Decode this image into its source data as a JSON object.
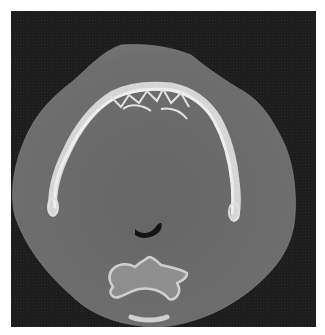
{
  "image": {
    "type": "axial CT slice",
    "description": "Axial CT of lower face at mandible level showing U-shaped mandibular arch, soft tissue, oropharyngeal airway and cervical vertebra",
    "colors": {
      "background": "#ffffff",
      "air": "#1e1e1e",
      "soft_tissue": "#6b6b6b",
      "soft_tissue_outer": "#767676",
      "bone": "#d8d8d8",
      "bone_bright": "#ececec",
      "airway": "#141414"
    },
    "structures": [
      {
        "name": "soft-tissue-outline",
        "label": "Soft tissue"
      },
      {
        "name": "mandible",
        "label": "Mandible"
      },
      {
        "name": "airway",
        "label": "Oropharyngeal airway"
      },
      {
        "name": "vertebra",
        "label": "Cervical vertebra"
      }
    ]
  }
}
